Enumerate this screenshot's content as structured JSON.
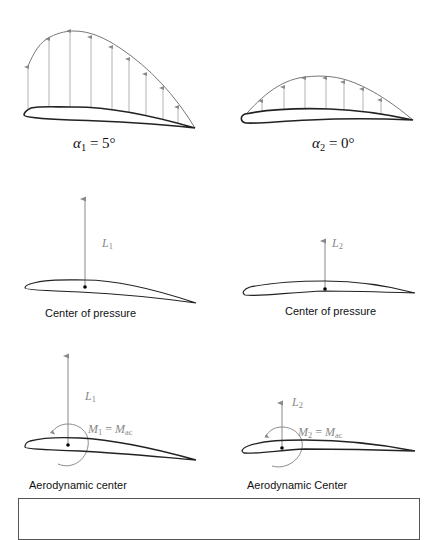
{
  "figure": {
    "type": "airfoil-lift-moment-diagram",
    "panels": [
      {
        "id": "pressure-distribution-1",
        "angle_label": {
          "symbol": "α",
          "subscript": "1",
          "rest": " = 5°"
        },
        "arrow_count": 9
      },
      {
        "id": "pressure-distribution-2",
        "angle_label": {
          "symbol": "α",
          "subscript": "2",
          "rest": " = 0°"
        },
        "arrow_count": 7
      },
      {
        "id": "center-of-pressure-1",
        "force_label": {
          "symbol": "L",
          "subscript": "1"
        },
        "caption": "Center of pressure"
      },
      {
        "id": "center-of-pressure-2",
        "force_label": {
          "symbol": "L",
          "subscript": "2"
        },
        "caption": "Center of pressure"
      },
      {
        "id": "aerodynamic-center-1",
        "force_label": {
          "symbol": "L",
          "subscript": "1"
        },
        "moment_label": {
          "lhs": "M",
          "lhs_sub": "1",
          "eq": " = ",
          "rhs": "M",
          "rhs_sub": "ac"
        },
        "caption": "Aerodynamic center"
      },
      {
        "id": "aerodynamic-center-2",
        "force_label": {
          "symbol": "L",
          "subscript": "2"
        },
        "moment_label": {
          "lhs": "M",
          "lhs_sub": "2",
          "eq": " = ",
          "rhs": "M",
          "rhs_sub": "ac"
        },
        "caption": "Aerodynamic Center"
      }
    ],
    "colors": {
      "airfoil": "#222222",
      "arrows": "#8a8a8a",
      "force_label": "#8a8a8a",
      "text": "#111111"
    }
  }
}
